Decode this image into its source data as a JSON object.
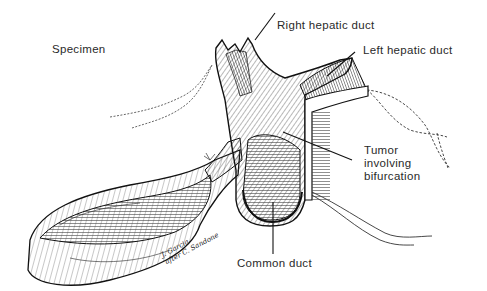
{
  "figure": {
    "title": "Specimen",
    "labels": {
      "specimen": "Specimen",
      "right_hepatic_duct": "Right hepatic duct",
      "left_hepatic_duct": "Left hepatic duct",
      "tumor": "Tumor\ninvolving\nbifurcation",
      "common_duct": "Common duct"
    },
    "signature": "J. Garcia\nafter C. Sandone"
  },
  "colors": {
    "background": "#ffffff",
    "ink": "#1a1a1a",
    "label_text": "#2a2a2a"
  }
}
